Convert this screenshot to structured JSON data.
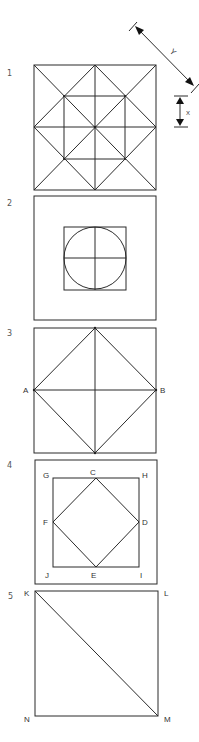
{
  "figures": [
    {
      "number": "1",
      "description": "Square subdivided into quarters by midlines, with both diagonals, a diamond joining edge midpoints, and an inner square joining the quarter-diagonal intersections",
      "dimensions": [
        {
          "label": "Y",
          "type": "diagonal",
          "meaning": "diagonal length"
        },
        {
          "label": "X",
          "type": "vertical",
          "meaning": "unit length"
        }
      ]
    },
    {
      "number": "2",
      "description": "Outer square with a smaller centered square containing an inscribed circle divided by horizontal and vertical diameters"
    },
    {
      "number": "3",
      "description": "Square with inscribed diamond and midlines; points A and B at left and right edge midpoints",
      "points": [
        "A",
        "B"
      ]
    },
    {
      "number": "4",
      "description": "Outer square containing inner square GHIJ with inscribed diamond CDEF through edge midpoints",
      "points": [
        "G",
        "C",
        "H",
        "F",
        "D",
        "J",
        "E",
        "I"
      ]
    },
    {
      "number": "5",
      "description": "Square KLMN with diagonal from K to M",
      "points": [
        "K",
        "L",
        "M",
        "N"
      ]
    }
  ],
  "labels": {
    "fig1": "1",
    "fig2": "2",
    "fig3": "3",
    "fig4": "4",
    "fig5": "5",
    "dimY": "Y",
    "dimX": "X",
    "A": "A",
    "B": "B",
    "C": "C",
    "D": "D",
    "E": "E",
    "F": "F",
    "G": "G",
    "H": "H",
    "I": "I",
    "J": "J",
    "K": "K",
    "L": "L",
    "M": "M",
    "N": "N"
  },
  "colors": {
    "stroke": "#2a2a2a",
    "background": "#ffffff"
  }
}
